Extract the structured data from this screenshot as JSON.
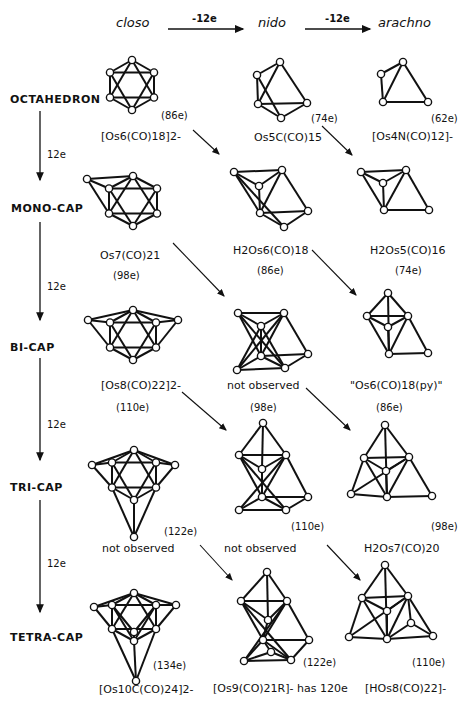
{
  "header": {
    "columns": [
      "closo",
      "nido",
      "arachno"
    ],
    "transitions": [
      "-12e",
      "-12e"
    ]
  },
  "rows": [
    {
      "label": "OCTAHEDRON",
      "step": "12e"
    },
    {
      "label": "MONO-CAP",
      "step": "12e"
    },
    {
      "label": "BI-CAP",
      "step": "12e"
    },
    {
      "label": "TRI-CAP",
      "step": "12e"
    },
    {
      "label": "TETRA-CAP",
      "step": ""
    }
  ],
  "cells": {
    "oct_closo": {
      "formula": "[Os6(CO)18]2-",
      "electrons": "(86e)"
    },
    "oct_nido": {
      "formula": "Os5C(CO)15",
      "electrons": "(74e)"
    },
    "oct_arachno": {
      "formula": "[Os4N(CO)12]-",
      "electrons": "(62e)"
    },
    "mono_closo": {
      "formula": "Os7(CO)21",
      "electrons": "(98e)"
    },
    "mono_nido": {
      "formula": "H2Os6(CO)18",
      "electrons": "(86e)"
    },
    "mono_arachno": {
      "formula": "H2Os5(CO)16",
      "electrons": "(74e)"
    },
    "bi_closo": {
      "formula": "[Os8(CO)22]2-",
      "electrons": "(110e)"
    },
    "bi_nido": {
      "formula": "not observed",
      "electrons": "(98e)"
    },
    "bi_arachno": {
      "formula": "\"Os6(CO)18(py)\"",
      "electrons": "(86e)"
    },
    "tri_closo": {
      "formula": "not observed",
      "electrons": "(122e)"
    },
    "tri_nido": {
      "formula": "not observed",
      "electrons": "(110e)"
    },
    "tri_arachno": {
      "formula": "H2Os7(CO)20",
      "electrons": "(98e)"
    },
    "tetra_closo": {
      "formula": "[Os10C(CO)24]2-",
      "electrons": "(134e)"
    },
    "tetra_nido": {
      "formula": "[Os9(CO)21R]- has 120e",
      "electrons": "(122e)"
    },
    "tetra_arachno": {
      "formula": "[HOs8(CO)22]-",
      "electrons": "(110e)"
    }
  },
  "colors": {
    "ink": "#111111",
    "background": "#ffffff"
  }
}
